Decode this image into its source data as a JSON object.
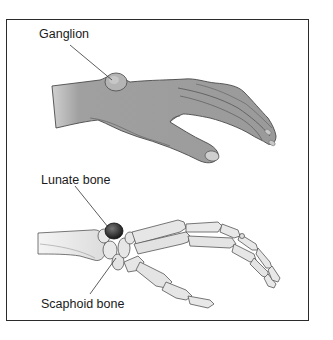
{
  "figure": {
    "labels": {
      "ganglion": "Ganglion",
      "lunate": "Lunate bone",
      "scaphoid": "Scaphoid bone"
    },
    "panels": [
      {
        "name": "external-hand-view",
        "annotation": "Ganglion"
      },
      {
        "name": "skeletal-hand-view",
        "annotations": [
          "Lunate bone",
          "Scaphoid bone"
        ]
      }
    ],
    "colors": {
      "skin": "#9a9a9a",
      "skin_shadow": "#7c7c7c",
      "bone": "#e6e6e6",
      "bone_outline": "#555555",
      "lunate_highlight": "#2a2a2a",
      "frame": "#2b2b2b"
    }
  }
}
